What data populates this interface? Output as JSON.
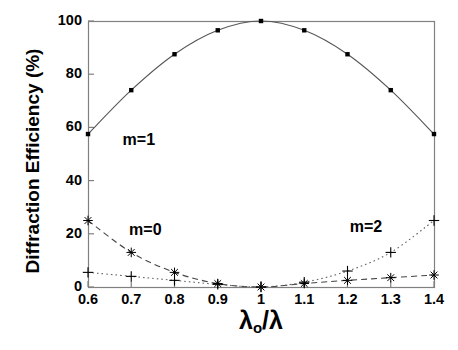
{
  "chart_data": {
    "type": "line",
    "title": "",
    "xlabel": "λₒ/λ",
    "xlabel_base": "λ",
    "xlabel_sub": "o",
    "xlabel_tail": "/λ",
    "ylabel": "Diffraction Efficiency (%)",
    "xlim": [
      0.6,
      1.4
    ],
    "ylim": [
      0,
      100
    ],
    "xticks": [
      0.6,
      0.7,
      0.8,
      0.9,
      1,
      1.1,
      1.2,
      1.3,
      1.4
    ],
    "xticklabels": [
      "0.6",
      "0.7",
      "0.8",
      "0.9",
      "1",
      "1.1",
      "1.2",
      "1.3",
      "1.4"
    ],
    "yticks": [
      0,
      20,
      40,
      60,
      80,
      100
    ],
    "yticklabels": [
      "0",
      "20",
      "40",
      "60",
      "80",
      "100"
    ],
    "grid": false,
    "legend": "inline annotations",
    "x": [
      0.6,
      0.7,
      0.8,
      0.9,
      1.0,
      1.1,
      1.2,
      1.3,
      1.4
    ],
    "series": [
      {
        "name": "m=1",
        "label": "m=1",
        "marker": "square",
        "linestyle": "solid",
        "color": "#555555",
        "marker_color": "#000000",
        "label_x": 0.68,
        "label_y": 55,
        "values": [
          57.5,
          74.0,
          87.5,
          96.5,
          100.0,
          96.5,
          87.5,
          74.0,
          57.5
        ]
      },
      {
        "name": "m=0",
        "label": "m=0",
        "marker": "asterisk",
        "linestyle": "dashed",
        "color": "#444444",
        "marker_color": "#000000",
        "label_x": 0.695,
        "label_y": 21,
        "values": [
          25.0,
          13.0,
          5.5,
          1.3,
          0.0,
          1.3,
          2.5,
          3.5,
          4.5
        ]
      },
      {
        "name": "m=2",
        "label": "m=2",
        "marker": "plus",
        "linestyle": "dotted",
        "color": "#666666",
        "marker_color": "#000000",
        "label_x": 1.205,
        "label_y": 22,
        "values": [
          5.5,
          4.0,
          2.5,
          1.0,
          0.0,
          1.8,
          6.0,
          13.0,
          25.0
        ]
      }
    ],
    "axis_color": "#808080",
    "frame": {
      "left": 88,
      "right": 434,
      "top": 21,
      "bottom": 287
    }
  }
}
